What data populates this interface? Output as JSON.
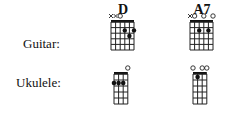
{
  "row_labels": {
    "guitar": "Guitar:",
    "ukulele": "Ukulele:"
  },
  "chords": [
    {
      "name": "D",
      "guitar": {
        "strings": 6,
        "markers": [
          "x",
          "x",
          "o",
          "",
          "",
          ""
        ],
        "dots": [
          [
            4,
            2
          ],
          [
            6,
            2
          ],
          [
            5,
            3
          ]
        ]
      },
      "ukulele": {
        "strings": 4,
        "markers": [
          "",
          "",
          "",
          "o"
        ],
        "dots": [
          [
            1,
            2
          ],
          [
            2,
            2
          ],
          [
            3,
            2
          ]
        ]
      }
    },
    {
      "name": "A7",
      "guitar": {
        "strings": 6,
        "markers": [
          "x",
          "o",
          "",
          "o",
          "",
          "o"
        ],
        "dots": [
          [
            3,
            2
          ],
          [
            5,
            2
          ]
        ]
      },
      "ukulele": {
        "strings": 4,
        "markers": [
          "o",
          "",
          "o",
          "o"
        ],
        "dots": [
          [
            2,
            1
          ]
        ]
      }
    }
  ]
}
